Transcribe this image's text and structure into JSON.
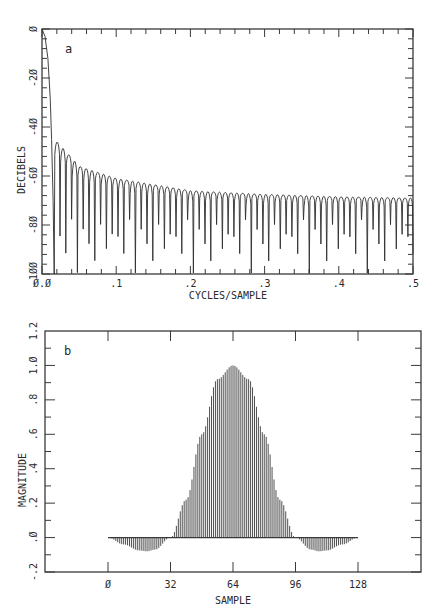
{
  "chart_data": [
    {
      "panel": "a",
      "type": "line",
      "title": "",
      "panel_label": "a",
      "xlabel": "CYCLES/SAMPLE",
      "ylabel": "DECIBELS",
      "xlim": [
        0.0,
        0.5
      ],
      "ylim": [
        -100,
        0
      ],
      "x_ticks": [
        0.0,
        0.1,
        0.2,
        0.3,
        0.4,
        0.5
      ],
      "x_tick_labels": [
        "0.0",
        ".1",
        ".2",
        ".3",
        ".4",
        ".5"
      ],
      "y_ticks": [
        0,
        -20,
        -40,
        -60,
        -80,
        -100
      ],
      "y_tick_labels": [
        "0",
        "-20",
        "-40",
        "-60",
        "-80",
        "-100"
      ],
      "grid": false,
      "description": "Log-magnitude frequency response of a 128-point windowed filter: main lobe falls from 0 dB at 0 to below -100 dB near 0.016 cycles/sample; sidelobes spaced ~1/128 apart with peaks decaying from about -46 dB to about -69 dB at 0.5, nulls dipping toward -80 to -100 dB.",
      "main_lobe": {
        "x": [
          0.0,
          0.004,
          0.008,
          0.011,
          0.013,
          0.015,
          0.0165
        ],
        "y": [
          0,
          -3,
          -12,
          -28,
          -45,
          -70,
          -100
        ]
      },
      "sidelobe_spacing": 0.0078125,
      "sidelobe_peaks": {
        "x": [
          0.02,
          0.05,
          0.1,
          0.2,
          0.3,
          0.4,
          0.5
        ],
        "y": [
          -46,
          -56,
          -61,
          -66,
          -67.5,
          -68.5,
          -69
        ]
      }
    },
    {
      "panel": "b",
      "type": "bar",
      "subtype": "stem",
      "title": "",
      "panel_label": "b",
      "xlabel": "SAMPLE",
      "ylabel": "MAGNITUDE",
      "xlim": [
        -45,
        180
      ],
      "ylim": [
        -0.2,
        1.2
      ],
      "x_ticks": [
        0,
        32,
        64,
        96,
        128
      ],
      "x_tick_labels": [
        "0",
        "32",
        "64",
        "96",
        "128"
      ],
      "y_ticks": [
        1.2,
        1.0,
        0.8,
        0.6,
        0.4,
        0.2,
        0.0,
        -0.2
      ],
      "y_tick_labels": [
        "1.2",
        "1.0",
        ".8",
        ".6",
        ".4",
        ".2",
        ".0",
        "-.2"
      ],
      "grid": false,
      "description": "Impulse response of 129 samples (0..128): symmetric pulse peaking at 1.0 at sample 64, crossing zero near samples 32 and 96, negative lobes reaching about -0.08 near samples 20 and 108, tapering to 0 at samples 0 and 128.",
      "x": [
        0,
        8,
        16,
        20,
        24,
        32,
        40,
        48,
        56,
        64,
        72,
        80,
        88,
        96,
        104,
        108,
        112,
        120,
        128
      ],
      "values": [
        0.0,
        -0.04,
        -0.075,
        -0.08,
        -0.07,
        0.0,
        0.22,
        0.6,
        0.92,
        1.0,
        0.92,
        0.6,
        0.22,
        0.0,
        -0.07,
        -0.08,
        -0.075,
        -0.04,
        0.0
      ]
    }
  ],
  "figure": {
    "caption_fragment": ""
  }
}
